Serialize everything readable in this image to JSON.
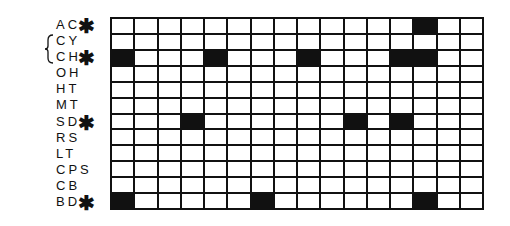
{
  "diagram": {
    "columns": 16,
    "rows": [
      {
        "label": "AC",
        "marked": true,
        "filled": [
          14
        ]
      },
      {
        "label": "CY",
        "marked": false,
        "filled": []
      },
      {
        "label": "CH",
        "marked": true,
        "filled": [
          1,
          5,
          9,
          13,
          14
        ]
      },
      {
        "label": "OH",
        "marked": false,
        "filled": []
      },
      {
        "label": "HT",
        "marked": false,
        "filled": []
      },
      {
        "label": "MT",
        "marked": false,
        "filled": []
      },
      {
        "label": "SD",
        "marked": true,
        "filled": [
          4,
          11,
          13
        ]
      },
      {
        "label": "RS",
        "marked": false,
        "filled": []
      },
      {
        "label": "LT",
        "marked": false,
        "filled": []
      },
      {
        "label": "CPS",
        "marked": false,
        "filled": []
      },
      {
        "label": "CB",
        "marked": false,
        "filled": []
      },
      {
        "label": "BD",
        "marked": true,
        "filled": [
          1,
          7,
          14
        ]
      }
    ],
    "bracket_rows": [
      "CH",
      "OH"
    ],
    "marker_symbol": "✱",
    "colors": {
      "filled": "#111111",
      "empty": "#ffffff",
      "line": "#111111"
    }
  }
}
